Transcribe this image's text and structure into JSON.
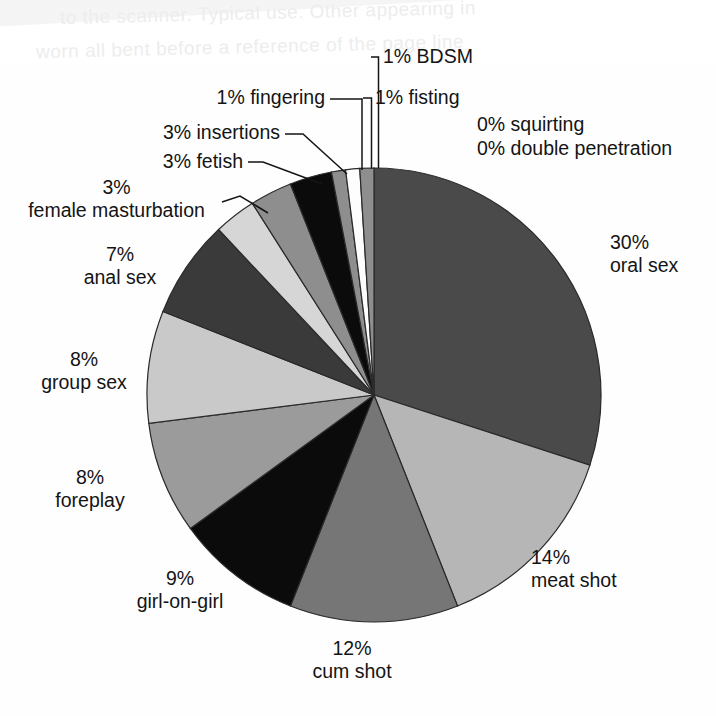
{
  "page": {
    "background_color": "#ffffff",
    "bleed_text_line1": "to the scanner. Typical use. Other appearing in",
    "bleed_text_line2": "worn all bent before a reference of the page line"
  },
  "chart_data": {
    "type": "pie",
    "title": "",
    "subtitle": "",
    "xlabel": "",
    "ylabel": "",
    "legend_position": "callout-labels",
    "grid": false,
    "units": "percent",
    "start_angle_deg": 0,
    "direction": "clockwise",
    "categories": [
      "oral sex",
      "meat shot",
      "cum shot",
      "girl-on-girl",
      "foreplay",
      "group sex",
      "anal sex",
      "female masturbation",
      "fetish",
      "insertions",
      "fingering",
      "fisting",
      "BDSM",
      "squirting",
      "double penetration"
    ],
    "values": [
      30,
      14,
      12,
      9,
      8,
      8,
      7,
      3,
      3,
      3,
      1,
      1,
      1,
      0,
      0
    ],
    "value_labels": [
      "30%",
      "14%",
      "12%",
      "9%",
      "8%",
      "8%",
      "7%",
      "3%",
      "3%",
      "3%",
      "1%",
      "1%",
      "1%",
      "0%",
      "0%"
    ],
    "slice_colors": [
      "#4a4a4a",
      "#b6b6b6",
      "#767676",
      "#0b0b0b",
      "#9b9b9b",
      "#c9c9c9",
      "#3a3a3a",
      "#d6d6d6",
      "#8e8e8e",
      "#0b0b0b",
      "#8e8e8e",
      "#fdfdfd",
      "#8e8e8e"
    ],
    "slice_stroke": "#2a2a2a",
    "zero_slices": [
      "squirting",
      "double penetration"
    ]
  },
  "labels": {
    "oral_sex": {
      "pct": "30%",
      "name": "oral sex"
    },
    "meat_shot": {
      "pct": "14%",
      "name": "meat shot"
    },
    "cum_shot": {
      "pct": "12%",
      "name": "cum shot"
    },
    "girl_on_girl": {
      "pct": "9%",
      "name": "girl-on-girl"
    },
    "foreplay": {
      "pct": "8%",
      "name": "foreplay"
    },
    "group_sex": {
      "pct": "8%",
      "name": "group sex"
    },
    "anal_sex": {
      "pct": "7%",
      "name": "anal sex"
    },
    "female_masturbation": {
      "pct": "3%",
      "name": "female masturbation"
    },
    "fetish": {
      "text": "3% fetish"
    },
    "insertions": {
      "text": "3% insertions"
    },
    "fingering": {
      "text": "1% fingering"
    },
    "fisting": {
      "text": "1% fisting"
    },
    "bdsm": {
      "text": "1% BDSM"
    },
    "squirting": {
      "text": "0% squirting"
    },
    "double_penetration": {
      "text": "0% double penetration"
    }
  }
}
